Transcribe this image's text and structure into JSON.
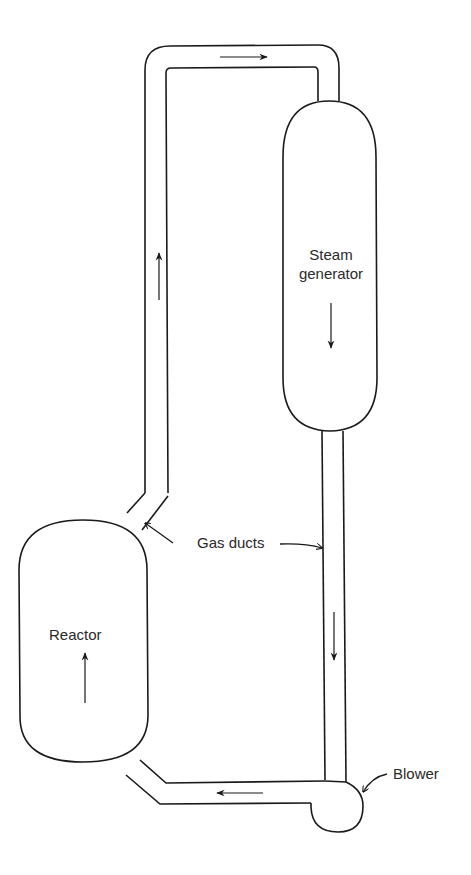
{
  "diagram": {
    "type": "gas-cooled reactor flow loop",
    "components": [
      {
        "id": "reactor",
        "label": "Reactor",
        "flow_direction": "up"
      },
      {
        "id": "steam-generator",
        "label_line1": "Steam",
        "label_line2": "generator",
        "flow_direction": "down"
      },
      {
        "id": "blower",
        "label": "Blower"
      }
    ],
    "annotations": {
      "gas_ducts": "Gas ducts"
    },
    "flow": [
      {
        "from": "reactor",
        "to": "steam-generator",
        "via": "upper gas duct",
        "arrows": [
          "up",
          "right"
        ]
      },
      {
        "from": "steam-generator",
        "to": "blower",
        "via": "right gas duct",
        "arrows": [
          "down"
        ]
      },
      {
        "from": "blower",
        "to": "reactor",
        "via": "lower duct",
        "arrows": [
          "left"
        ]
      }
    ],
    "colors": {
      "line": "#1a1a1a",
      "text": "#2a2a2a",
      "background": "#ffffff"
    }
  }
}
